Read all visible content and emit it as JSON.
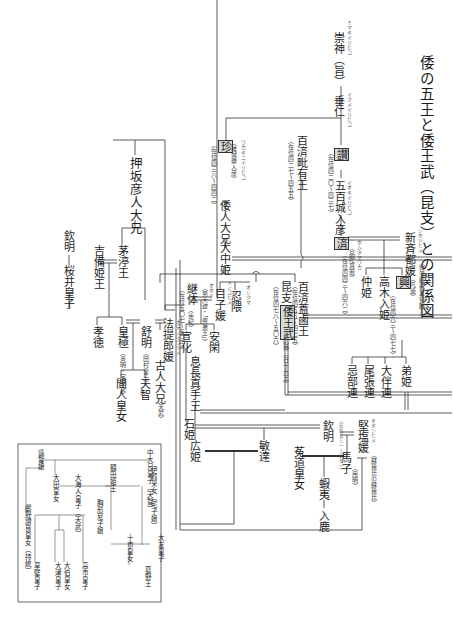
{
  "title": "倭の五王と倭王武（昆支）との関係図",
  "people": {
    "sujin": {
      "name": "崇神（旨）",
      "ruby": "ミマキイリヒコ"
    },
    "suinin": {
      "name": "垂仁",
      "ruby": "イクメイリヒコ"
    },
    "san": {
      "mark": "讃",
      "note": "（在位四二〇〜四三七）"
    },
    "iokiiri": {
      "name": "五百城入彦",
      "ruby": "イオキイリヒコ"
    },
    "sei": {
      "mark": "済",
      "ruby": "ホムタマワカ",
      "alias": "（品陀真若）",
      "note": "（在位四四三〜四六二）"
    },
    "niiki": {
      "name": "新斉都媛",
      "ruby": "シセツヒメ",
      "alias": "（百済毗有王の娘）"
    },
    "chin": {
      "mark": "珍",
      "alias": "（稚城瓊入彦）",
      "ruby": "ワカキニイリヒコ",
      "note": "（在位四三八〜四四二）"
    },
    "homutawake": {
      "name": "倭人大兄"
    },
    "onakahime": {
      "name": "大中姫"
    },
    "bizu": {
      "name": "百済毗有王",
      "note": "（在位四二七〜四五五）"
    },
    "gaero": {
      "name": "百済蓋鹵王",
      "note": "（在位四五五〜四七五）"
    },
    "konki": {
      "name": "昆支",
      "mark": "倭王武",
      "alias": "・応神（日十大王）",
      "note": "（在位四七八〜五〇六）"
    },
    "oshikuma": {
      "name": "忍隈",
      "ruby": "オシクマ"
    },
    "menoko": {
      "name": "目子媛",
      "ruby": "メノコヒメ"
    },
    "keitai": {
      "name": "継体",
      "alias": "（余紀）",
      "note": "（在位五〇七〜五三一）"
    },
    "ohodo": {
      "name": "（男大迹・「男弟王」）",
      "ruby": "オホド"
    },
    "senka": {
      "name": "宣化"
    },
    "ankan": {
      "name": "安閑"
    },
    "nakahime": {
      "name": "仲姫"
    },
    "takaki": {
      "name": "高木入姫"
    },
    "ko": {
      "mark": "興",
      "alias": "（凡連）",
      "ruby": "オオシムラジ",
      "note": "（在位四六三〜四七七）"
    },
    "otohime": {
      "name": "弟姫"
    },
    "otomo": {
      "name": "大伴連"
    },
    "owari": {
      "name": "尾張連"
    },
    "osakabe": {
      "name": "忌部連"
    },
    "oshisaka": {
      "name": "押坂彦人大兄"
    },
    "chinu": {
      "name": "茅渟王"
    },
    "kinmei_top": {
      "name": "欽明"
    },
    "sakurai": {
      "name": "桜井皇子"
    },
    "kibi": {
      "name": "吉備姫王"
    },
    "kotoku": {
      "name": "孝徳"
    },
    "kogyoku": {
      "name": "皇極",
      "alias": "（斉明・宝皇女）"
    },
    "jomei": {
      "name": "舒明",
      "alias": "（田村皇子）"
    },
    "hote": {
      "name": "法提郎媛",
      "ruby": "ホテノイラツメ"
    },
    "furuhito": {
      "name": "古人大兄",
      "alias": "（天武）"
    },
    "hashihito": {
      "name": "間人皇女"
    },
    "tenji": {
      "name": "天智"
    },
    "okinaga": {
      "name": "息長真手王"
    },
    "ishihime": {
      "name": "石姫"
    },
    "hirohime": {
      "name": "広姫"
    },
    "bidatsu": {
      "name": "敏達"
    },
    "kinmei": {
      "name": "欽明",
      "note": "（在位五三一〜五七一）"
    },
    "kitashi": {
      "name": "堅塩媛",
      "ruby": "キタシヒメ",
      "alias": "（蘇我氏の蘇我氏）"
    },
    "umako": {
      "name": "馬子",
      "alias": "（用明）"
    },
    "ubara": {
      "name": "菟道皇女"
    },
    "emishi": {
      "name": "蝦夷"
    },
    "iruka": {
      "name": "入鹿"
    }
  },
  "inset": {
    "people": [
      {
        "id": "ochi",
        "name": "遠智娘"
      },
      {
        "id": "naka",
        "name": "中大兄皇子（天智）"
      },
      {
        "id": "iga",
        "name": "伊賀采女（宅子娘）"
      },
      {
        "id": "nukata",
        "name": "額田姫王"
      },
      {
        "id": "ota",
        "name": "大田皇女"
      },
      {
        "id": "ooama",
        "name": "大海人皇子（天武）"
      },
      {
        "id": "uno",
        "name": "鸕野讃良皇女（持統）"
      },
      {
        "id": "amako",
        "name": "胸形尼子娘"
      },
      {
        "id": "toichi",
        "name": "十市皇女"
      },
      {
        "id": "otomo_p",
        "name": "大友皇子"
      },
      {
        "id": "kadono",
        "name": "葛野王"
      },
      {
        "id": "kusakabe",
        "name": "草壁皇子"
      },
      {
        "id": "otsu",
        "name": "大津皇子"
      },
      {
        "id": "oku",
        "name": "大伯皇女"
      },
      {
        "id": "takechi",
        "name": "高市皇子"
      }
    ]
  }
}
